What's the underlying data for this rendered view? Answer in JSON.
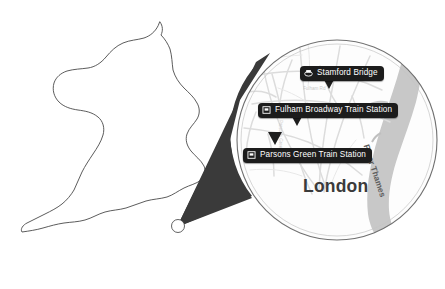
{
  "figure": {
    "type": "locator-map",
    "region_outline": "England and Wales",
    "city_marker": "London"
  },
  "colors": {
    "cone_fill": "#3a3a3a",
    "label_background": "#1c1c1c",
    "label_text": "#ffffff",
    "city_text": "#3b3b3b",
    "river_fill": "#c8c8c8",
    "river_text": "#5e5e5e",
    "road_stroke": "#d9d9d9",
    "coastline_stroke": "#6e6e6e",
    "page_background": "#ffffff"
  },
  "pois": [
    {
      "id": "stamford-bridge",
      "label": "Stamford Bridge",
      "icon": "stadium-icon"
    },
    {
      "id": "fulham-broadway",
      "label": "Fulham Broadway Train Station",
      "icon": "train-station-icon"
    },
    {
      "id": "parsons-green",
      "label": "Parsons Green Train Station",
      "icon": "train-station-icon"
    }
  ],
  "city": {
    "name": "London"
  },
  "river": {
    "name": "River Thames"
  },
  "streets": [
    {
      "id": "fulham-rd",
      "name": "Fulham Rd"
    },
    {
      "id": "vertical-road",
      "name": "Parsons Green"
    }
  ]
}
